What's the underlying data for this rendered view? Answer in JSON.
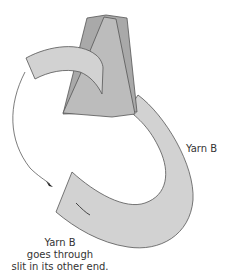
{
  "diagram": {
    "colors": {
      "background": "#ffffff",
      "fabric_dark": "#a9a9a9",
      "fabric_mid": "#bcbcbc",
      "yarn_fill": "#d2d2d2",
      "outline": "#555555",
      "arrow": "#444444"
    },
    "labels": {
      "right": "Yarn B",
      "bottom_line1": "Yarn B",
      "bottom_line2": "goes through",
      "bottom_line3": "slit in its other end."
    }
  }
}
